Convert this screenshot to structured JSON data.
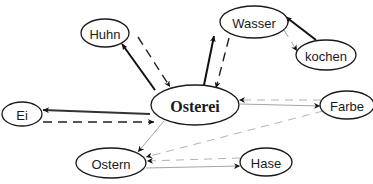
{
  "diagram": {
    "type": "directed-graph",
    "nodes": [
      {
        "id": "osterei",
        "label": "Osterei",
        "central": true
      },
      {
        "id": "huhn",
        "label": "Huhn"
      },
      {
        "id": "wasser",
        "label": "Wasser"
      },
      {
        "id": "kochen",
        "label": "kochen"
      },
      {
        "id": "ei",
        "label": "Ei"
      },
      {
        "id": "farbe",
        "label": "Farbe"
      },
      {
        "id": "ostern",
        "label": "Ostern"
      },
      {
        "id": "hase",
        "label": "Hase"
      }
    ],
    "edges": [
      {
        "from": "osterei",
        "to": "huhn",
        "style": "solid",
        "weight": "strong",
        "color": "#111111"
      },
      {
        "from": "huhn",
        "to": "osterei",
        "style": "dashed",
        "weight": "strong",
        "color": "#222222"
      },
      {
        "from": "osterei",
        "to": "wasser",
        "style": "solid",
        "weight": "strong",
        "color": "#111111"
      },
      {
        "from": "wasser",
        "to": "osterei",
        "style": "dashed",
        "weight": "strong",
        "color": "#222222"
      },
      {
        "from": "kochen",
        "to": "wasser",
        "style": "solid",
        "weight": "strong",
        "color": "#111111"
      },
      {
        "from": "wasser",
        "to": "kochen",
        "style": "dashed",
        "weight": "weak",
        "color": "#999999"
      },
      {
        "from": "osterei",
        "to": "ei",
        "style": "solid",
        "weight": "strong",
        "color": "#333333"
      },
      {
        "from": "ei",
        "to": "osterei",
        "style": "dashed",
        "weight": "strong",
        "color": "#222222"
      },
      {
        "from": "osterei",
        "to": "farbe",
        "style": "solid",
        "weight": "weak",
        "color": "#9a9a9a"
      },
      {
        "from": "farbe",
        "to": "osterei",
        "style": "dashed",
        "weight": "weak",
        "color": "#aaaaaa"
      },
      {
        "from": "osterei",
        "to": "ostern",
        "style": "solid",
        "weight": "weak",
        "color": "#9a9a9a"
      },
      {
        "from": "farbe",
        "to": "ostern",
        "style": "dashed",
        "weight": "weak",
        "color": "#aaaaaa"
      },
      {
        "from": "hase",
        "to": "ostern",
        "style": "dashed",
        "weight": "weak",
        "color": "#aaaaaa"
      },
      {
        "from": "ostern",
        "to": "hase",
        "style": "solid",
        "weight": "weak",
        "color": "#9a9a9a"
      }
    ]
  }
}
